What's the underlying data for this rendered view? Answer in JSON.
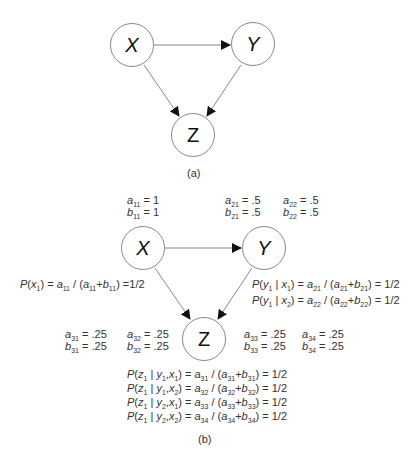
{
  "diagram_a": {
    "caption": "(a)",
    "nodes": [
      {
        "id": "X",
        "label": "X"
      },
      {
        "id": "Y",
        "label": "Y"
      },
      {
        "id": "Z",
        "label": "Z"
      }
    ],
    "edges": [
      {
        "from": "X",
        "to": "Y"
      },
      {
        "from": "X",
        "to": "Z"
      },
      {
        "from": "Y",
        "to": "Z"
      }
    ]
  },
  "diagram_b": {
    "caption": "(b)",
    "nodes": [
      {
        "id": "X",
        "label": "X"
      },
      {
        "id": "Y",
        "label": "Y"
      },
      {
        "id": "Z",
        "label": "Z"
      }
    ],
    "edges": [
      {
        "from": "X",
        "to": "Y"
      },
      {
        "from": "X",
        "to": "Z"
      },
      {
        "from": "Y",
        "to": "Z"
      }
    ],
    "params": {
      "a11": "1",
      "b11": "1",
      "a21": ".5",
      "b21": ".5",
      "a22": ".5",
      "b22": ".5",
      "a31": ".25",
      "b31": ".25",
      "a32": ".25",
      "b32": ".25",
      "a33": ".25",
      "b33": ".25",
      "a34": ".25",
      "b34": ".25"
    },
    "formulas": {
      "px1": "P(x1) = a11 / (a11+b11) =1/2",
      "py1_x1": "P(y1 | x1) = a21 / (a21+b21) = 1/2",
      "py1_x2": "P(y1 | x2) = a22 / (a22+b22) = 1/2",
      "pz1_y1x1": "P(z1 | y1,x1) = a31 / (a31+b31) = 1/2",
      "pz1_y1x2": "P(z1 | y1,x2) = a32 / (a32+b32) = 1/2",
      "pz1_y2x1": "P(z1 | y2,x1) = a33 / (a33+b33) = 1/2",
      "pz1_y2x2": "P(z1 | y2,x2) = a34 / (a34+b34) = 1/2"
    },
    "results": {
      "px1": "=1/2",
      "py1_x1": "= 1/2",
      "py1_x2": "= 1/2",
      "pz1_y1x1": "= 1/2",
      "pz1_y1x2": "= 1/2",
      "pz1_y2x1": "= 1/2",
      "pz1_y2x2": "= 1/2"
    }
  }
}
